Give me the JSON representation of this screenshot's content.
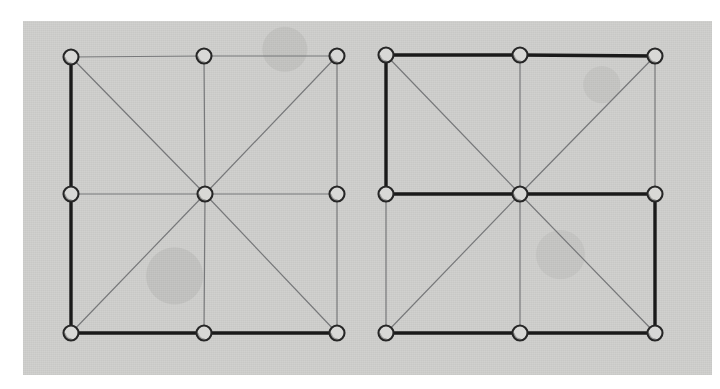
{
  "figure": {
    "background_color": "#ffffff",
    "scan_color": "#cfcfcd",
    "thin_edge_color": "#77787a",
    "bold_edge_color": "#1a1a1a",
    "node_fill_color": "#d8d8d6",
    "node_stroke_color": "#262626",
    "scan_panel": {
      "x": 23,
      "y": 21,
      "width": 689,
      "height": 354
    }
  },
  "diagrams": [
    {
      "id": "left-diagram",
      "label": "left-lattice-diagram",
      "node_radius": 7.5,
      "nodes": [
        {
          "id": "tl",
          "label": "top-left",
          "x": 71,
          "y": 57
        },
        {
          "id": "tm",
          "label": "top-middle",
          "x": 204,
          "y": 56
        },
        {
          "id": "tr",
          "label": "top-right",
          "x": 337,
          "y": 56
        },
        {
          "id": "ml",
          "label": "middle-left",
          "x": 71,
          "y": 194
        },
        {
          "id": "mc",
          "label": "center",
          "x": 205,
          "y": 194
        },
        {
          "id": "mr",
          "label": "middle-right",
          "x": 337,
          "y": 194
        },
        {
          "id": "bl",
          "label": "bottom-left",
          "x": 71,
          "y": 333
        },
        {
          "id": "bm",
          "label": "bottom-middle",
          "x": 204,
          "y": 333
        },
        {
          "id": "br",
          "label": "bottom-right",
          "x": 337,
          "y": 333
        }
      ],
      "thin_edges": [
        {
          "from": "tl",
          "to": "tm"
        },
        {
          "from": "tm",
          "to": "tr"
        },
        {
          "from": "tm",
          "to": "mc"
        },
        {
          "from": "tr",
          "to": "mr"
        },
        {
          "from": "ml",
          "to": "mc"
        },
        {
          "from": "mc",
          "to": "mr"
        },
        {
          "from": "mr",
          "to": "br"
        },
        {
          "from": "mc",
          "to": "bm"
        },
        {
          "from": "tl",
          "to": "mc"
        },
        {
          "from": "tr",
          "to": "mc"
        },
        {
          "from": "bl",
          "to": "mc"
        },
        {
          "from": "br",
          "to": "mc"
        }
      ],
      "bold_edges": [
        {
          "from": "tl",
          "to": "ml"
        },
        {
          "from": "ml",
          "to": "bl"
        },
        {
          "from": "bl",
          "to": "bm"
        },
        {
          "from": "bm",
          "to": "br"
        }
      ]
    },
    {
      "id": "right-diagram",
      "label": "right-lattice-diagram",
      "node_radius": 7.5,
      "nodes": [
        {
          "id": "tl",
          "label": "top-left",
          "x": 386,
          "y": 55
        },
        {
          "id": "tm",
          "label": "top-middle",
          "x": 520,
          "y": 55
        },
        {
          "id": "tr",
          "label": "top-right",
          "x": 655,
          "y": 56
        },
        {
          "id": "ml",
          "label": "middle-left",
          "x": 386,
          "y": 194
        },
        {
          "id": "mc",
          "label": "center",
          "x": 520,
          "y": 194
        },
        {
          "id": "mr",
          "label": "middle-right",
          "x": 655,
          "y": 194
        },
        {
          "id": "bl",
          "label": "bottom-left",
          "x": 386,
          "y": 333
        },
        {
          "id": "bm",
          "label": "bottom-middle",
          "x": 520,
          "y": 333
        },
        {
          "id": "br",
          "label": "bottom-right",
          "x": 655,
          "y": 333
        }
      ],
      "thin_edges": [
        {
          "from": "tm",
          "to": "mc"
        },
        {
          "from": "tr",
          "to": "mr"
        },
        {
          "from": "ml",
          "to": "bl"
        },
        {
          "from": "mc",
          "to": "bm"
        },
        {
          "from": "tl",
          "to": "mc"
        },
        {
          "from": "tr",
          "to": "mc"
        },
        {
          "from": "bl",
          "to": "mc"
        },
        {
          "from": "br",
          "to": "mc"
        }
      ],
      "bold_edges": [
        {
          "from": "tl",
          "to": "tm"
        },
        {
          "from": "tm",
          "to": "tr"
        },
        {
          "from": "tl",
          "to": "ml"
        },
        {
          "from": "ml",
          "to": "mc"
        },
        {
          "from": "mc",
          "to": "mr"
        },
        {
          "from": "mr",
          "to": "br"
        },
        {
          "from": "bl",
          "to": "bm"
        },
        {
          "from": "bm",
          "to": "br"
        }
      ]
    }
  ]
}
